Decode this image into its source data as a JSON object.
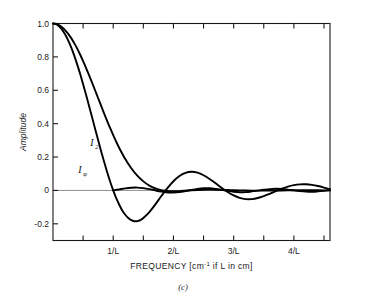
{
  "figure": {
    "caption": "(c)",
    "background": "#ffffff",
    "curve_color": "#000000",
    "axis_color": "#1a1a1a",
    "zero_line_color": "#8f8f8f"
  },
  "chart_data": {
    "type": "line",
    "title": "",
    "xlabel_parts": {
      "main": "FREQUENCY [cm",
      "exponent": "-1",
      "tail": " if L in cm]"
    },
    "xlabel": "FREQUENCY [cm-1 if L in cm]",
    "ylabel": "Amplitude",
    "xlim": [
      0,
      4.6
    ],
    "ylim": [
      -0.3,
      1.0
    ],
    "grid": false,
    "legend": "inline-annotations",
    "x_tick_labels": [
      "1/L",
      "2/L",
      "3/L",
      "4/L"
    ],
    "x_tick_values": [
      1,
      2,
      3,
      4
    ],
    "x_minor_tick_values": [
      0.5,
      1.5,
      2.5,
      3.5,
      4.5
    ],
    "y_tick_labels": [
      "1.0",
      "0.8",
      "0.6",
      "0.4",
      "0.2",
      "0",
      "-0.2"
    ],
    "y_tick_values": [
      1.0,
      0.8,
      0.6,
      0.4,
      0.2,
      0.0,
      -0.2
    ],
    "annotations": [
      {
        "name": "I2",
        "label": "I",
        "subscript": "2",
        "x": 0.62,
        "y": 0.265
      },
      {
        "name": "Iphi",
        "label": "I",
        "subscript": "φ",
        "x": 0.42,
        "y": 0.105
      }
    ],
    "series": [
      {
        "name": "I_phi",
        "label": "Iφ",
        "description": "sinc instrument function, unapodized",
        "x": [
          0,
          0.05,
          0.1,
          0.15,
          0.2,
          0.25,
          0.3,
          0.35,
          0.4,
          0.45,
          0.5,
          0.55,
          0.6,
          0.65,
          0.7,
          0.75,
          0.8,
          0.85,
          0.9,
          0.95,
          1.0,
          1.05,
          1.1,
          1.15,
          1.2,
          1.25,
          1.3,
          1.35,
          1.4,
          1.45,
          1.5,
          1.6,
          1.7,
          1.8,
          1.9,
          2.0,
          2.1,
          2.2,
          2.3,
          2.4,
          2.5,
          2.6,
          2.7,
          2.8,
          2.9,
          3.0,
          3.1,
          3.2,
          3.3,
          3.4,
          3.5,
          3.6,
          3.7,
          3.8,
          3.9,
          4.0,
          4.1,
          4.2,
          4.3,
          4.4,
          4.5,
          4.6
        ],
        "y": [
          1.0,
          0.9959,
          0.9836,
          0.9635,
          0.9355,
          0.9003,
          0.8584,
          0.8106,
          0.7568,
          0.6993,
          0.6366,
          0.5716,
          0.5046,
          0.4369,
          0.3679,
          0.3008,
          0.2339,
          0.1699,
          0.1093,
          0.0524,
          0.0,
          -0.0467,
          -0.0858,
          -0.1198,
          -0.1459,
          -0.1654,
          -0.1784,
          -0.1844,
          -0.1839,
          -0.1775,
          -0.1654,
          -0.1296,
          -0.0834,
          -0.0336,
          0.0138,
          0.0552,
          0.0865,
          0.1054,
          0.1117,
          0.1063,
          0.0909,
          0.0688,
          0.0424,
          0.0153,
          -0.0097,
          -0.0303,
          -0.0446,
          -0.0519,
          -0.0519,
          -0.0456,
          -0.0344,
          -0.0202,
          -0.0047,
          0.0101,
          0.0226,
          0.0316,
          0.0363,
          0.0367,
          0.0331,
          0.0262,
          0.0171,
          0.0069
        ]
      },
      {
        "name": "I_2",
        "label": "I2",
        "description": "apodized instrument function, broader main lobe, small side lobes",
        "x": [
          0,
          0.05,
          0.1,
          0.15,
          0.2,
          0.25,
          0.3,
          0.35,
          0.4,
          0.45,
          0.5,
          0.55,
          0.6,
          0.65,
          0.7,
          0.75,
          0.8,
          0.85,
          0.9,
          0.95,
          1.0,
          1.05,
          1.1,
          1.2,
          1.3,
          1.4,
          1.5,
          1.6,
          1.7,
          1.8,
          1.9,
          2.0,
          2.1,
          2.2,
          2.3,
          2.4,
          2.5,
          2.6,
          2.7,
          2.8,
          2.9,
          3.0,
          3.1,
          3.2,
          3.3,
          3.4,
          3.5,
          3.6,
          3.7,
          3.8,
          3.9,
          4.0,
          4.1,
          4.2,
          4.3,
          4.4,
          4.5,
          4.6
        ],
        "y": [
          1.0,
          0.9975,
          0.9901,
          0.9779,
          0.9609,
          0.9395,
          0.9138,
          0.8841,
          0.8508,
          0.8143,
          0.7749,
          0.7332,
          0.6896,
          0.6445,
          0.5986,
          0.5523,
          0.5061,
          0.4604,
          0.4158,
          0.3725,
          0.331,
          0.2916,
          0.2545,
          0.1882,
          0.133,
          0.0886,
          0.0543,
          0.0291,
          0.0119,
          0.0014,
          -0.0037,
          -0.005,
          -0.004,
          -0.0018,
          0.0006,
          0.0026,
          0.004,
          0.0045,
          0.0042,
          0.0034,
          0.0022,
          0.0011,
          0.0,
          -0.0008,
          -0.0013,
          -0.0015,
          -0.0014,
          -0.0011,
          -0.0006,
          -0.0001,
          0.0003,
          0.0007,
          0.0009,
          0.0009,
          0.0008,
          0.0006,
          0.0003,
          0.0001
        ]
      },
      {
        "name": "I_2_envelope",
        "label": "I2 oscillating tail",
        "description": "residual ripple of apodized function riding near zero",
        "x": [
          1.0,
          1.1,
          1.2,
          1.3,
          1.4,
          1.5,
          1.6,
          1.7,
          1.8,
          1.9,
          2.0,
          2.1,
          2.2,
          2.3,
          2.4,
          2.5,
          2.6,
          2.7,
          2.8,
          2.9,
          3.0,
          3.1,
          3.2,
          3.3,
          3.4,
          3.5,
          3.6,
          3.7,
          3.8,
          3.9,
          4.0,
          4.1,
          4.2,
          4.3,
          4.4,
          4.5,
          4.6
        ],
        "y": [
          0.0,
          0.006,
          0.012,
          0.016,
          0.017,
          0.014,
          0.008,
          0.0,
          -0.007,
          -0.012,
          -0.013,
          -0.01,
          -0.004,
          0.003,
          0.009,
          0.013,
          0.013,
          0.009,
          0.003,
          -0.003,
          -0.008,
          -0.011,
          -0.01,
          -0.006,
          -0.001,
          0.004,
          0.008,
          0.01,
          0.009,
          0.005,
          0.0,
          -0.004,
          -0.007,
          -0.008,
          -0.006,
          -0.003,
          0.001
        ]
      }
    ]
  }
}
